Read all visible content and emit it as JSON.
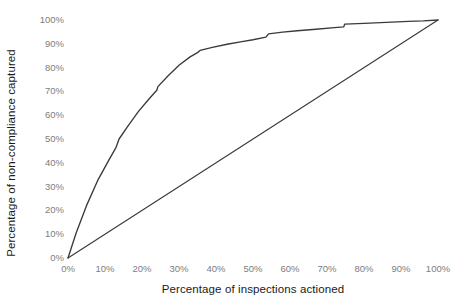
{
  "chart_data": {
    "type": "line",
    "title": "",
    "xlabel": "Percentage of inspections actioned",
    "ylabel": "Percentage of non-compliance captured",
    "xlim": [
      0,
      100
    ],
    "ylim": [
      0,
      100
    ],
    "grid": false,
    "legend": "none",
    "x_tick_labels": [
      "0%",
      "10%",
      "20%",
      "30%",
      "40%",
      "50%",
      "60%",
      "70%",
      "80%",
      "90%",
      "100%"
    ],
    "y_tick_labels": [
      "0%",
      "10%",
      "20%",
      "30%",
      "40%",
      "50%",
      "60%",
      "70%",
      "80%",
      "90%",
      "100%"
    ],
    "x_tick_values": [
      0,
      10,
      20,
      30,
      40,
      50,
      60,
      70,
      80,
      90,
      100
    ],
    "y_tick_values": [
      0,
      10,
      20,
      30,
      40,
      50,
      60,
      70,
      80,
      90,
      100
    ],
    "series": [
      {
        "name": "Model gain curve",
        "color": "#3a3a3a",
        "points": [
          [
            0,
            0
          ],
          [
            2.2,
            10.5
          ],
          [
            5.0,
            22.0
          ],
          [
            8.0,
            32.5
          ],
          [
            11.0,
            41.0
          ],
          [
            13.0,
            46.5
          ],
          [
            13.8,
            50.0
          ],
          [
            16.0,
            55.0
          ],
          [
            19.0,
            61.5
          ],
          [
            22.0,
            67.0
          ],
          [
            24.0,
            70.5
          ],
          [
            24.3,
            72.0
          ],
          [
            27.0,
            76.5
          ],
          [
            30.0,
            81.0
          ],
          [
            33.0,
            84.5
          ],
          [
            35.0,
            86.3
          ],
          [
            35.7,
            87.2
          ],
          [
            39.0,
            88.5
          ],
          [
            43.0,
            89.8
          ],
          [
            47.0,
            90.9
          ],
          [
            50.0,
            91.7
          ],
          [
            53.5,
            92.8
          ],
          [
            54.2,
            94.2
          ],
          [
            58.0,
            94.9
          ],
          [
            62.0,
            95.5
          ],
          [
            67.0,
            96.1
          ],
          [
            72.0,
            96.8
          ],
          [
            74.5,
            97.1
          ],
          [
            74.8,
            98.3
          ],
          [
            80.0,
            98.6
          ],
          [
            86.0,
            99.0
          ],
          [
            92.0,
            99.4
          ],
          [
            96.0,
            99.6
          ],
          [
            100,
            100
          ]
        ]
      },
      {
        "name": "Random baseline",
        "color": "#3a3a3a",
        "points": [
          [
            0,
            0
          ],
          [
            100,
            100
          ]
        ]
      }
    ]
  },
  "axes": {
    "x_title": "Percentage of inspections actioned",
    "y_title": "Percentage of non-compliance captured"
  }
}
